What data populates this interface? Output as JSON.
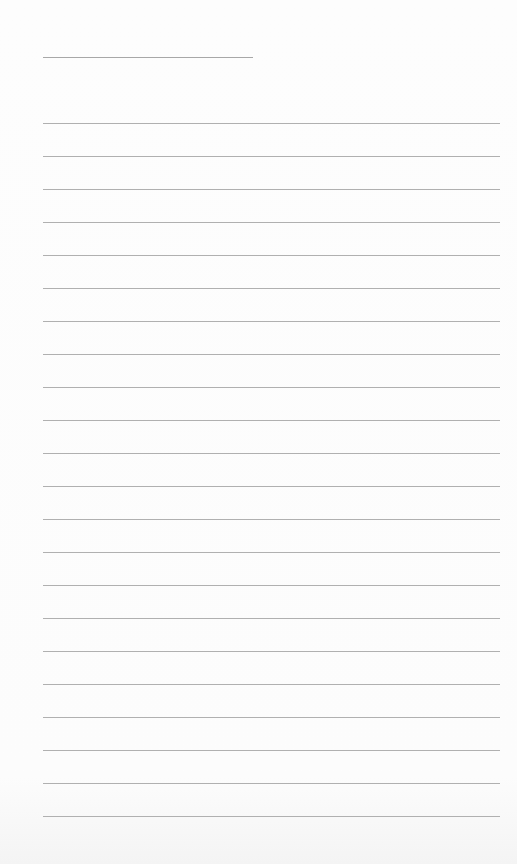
{
  "page": {
    "type": "lined-paper",
    "background_color": "#fdfdfd",
    "line_color": "#b0b0b0",
    "header_line": {
      "left": 43,
      "top": 57,
      "width": 210
    },
    "ruled_lines": {
      "left": 43,
      "width": 457,
      "first_top": 123,
      "spacing": 33,
      "count": 22
    }
  }
}
